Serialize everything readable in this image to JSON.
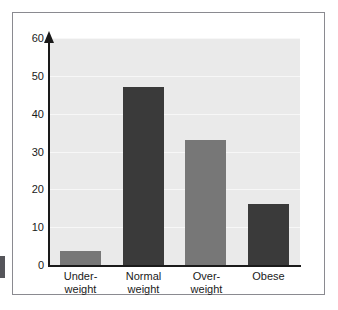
{
  "chart_data": {
    "type": "bar",
    "title": "",
    "subtitle": "",
    "xlabel": "",
    "ylabel": "",
    "categories": [
      "Under-weight",
      "Normal weight",
      "Over-weight",
      "Obese"
    ],
    "category_lines": [
      [
        "Under-",
        "weight"
      ],
      [
        "Normal",
        "weight"
      ],
      [
        "Over-",
        "weight"
      ],
      [
        "Obese",
        ""
      ]
    ],
    "values": [
      3.7,
      47,
      33,
      16
    ],
    "bar_colors": [
      "#777777",
      "#3a3a3a",
      "#777777",
      "#3a3a3a"
    ],
    "ylim": [
      0,
      60
    ],
    "yticks": [
      0,
      10,
      20,
      30,
      40,
      50,
      60
    ],
    "ytick_labels": [
      "0",
      "10",
      "20",
      "30",
      "40",
      "50",
      "60"
    ],
    "grid": true,
    "grid_color": "#f7f7f7",
    "legend": null,
    "plot_background": "#eaeaea",
    "axis_color": "#1a1a1a",
    "frame_color": "#8a8a90",
    "page_background": "#ffffff"
  }
}
